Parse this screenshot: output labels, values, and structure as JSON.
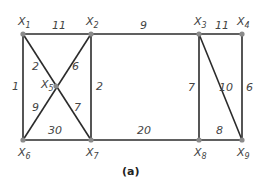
{
  "caption": "(a)",
  "colors": {
    "edge": "#2b2b2b",
    "node": "#8a8a8a",
    "text": "#444444"
  },
  "nodes": [
    {
      "id": "X1",
      "base": "X",
      "sub": "1",
      "x": 23,
      "y": 34
    },
    {
      "id": "X2",
      "base": "X",
      "sub": "2",
      "x": 91,
      "y": 34
    },
    {
      "id": "X3",
      "base": "X",
      "sub": "3",
      "x": 199,
      "y": 34
    },
    {
      "id": "X4",
      "base": "X",
      "sub": "4",
      "x": 242,
      "y": 34
    },
    {
      "id": "X5",
      "base": "X",
      "sub": "5",
      "x": 56,
      "y": 86
    },
    {
      "id": "X6",
      "base": "X",
      "sub": "6",
      "x": 23,
      "y": 140
    },
    {
      "id": "X7",
      "base": "X",
      "sub": "7",
      "x": 91,
      "y": 140
    },
    {
      "id": "X8",
      "base": "X",
      "sub": "8",
      "x": 199,
      "y": 140
    },
    {
      "id": "X9",
      "base": "X",
      "sub": "9",
      "x": 242,
      "y": 140
    }
  ],
  "edges": [
    {
      "from": "X1",
      "to": "X2",
      "weight": "11"
    },
    {
      "from": "X2",
      "to": "X3",
      "weight": "9"
    },
    {
      "from": "X3",
      "to": "X4",
      "weight": "11"
    },
    {
      "from": "X1",
      "to": "X6",
      "weight": "1"
    },
    {
      "from": "X1",
      "to": "X5",
      "weight": "2"
    },
    {
      "from": "X2",
      "to": "X5",
      "weight": "6"
    },
    {
      "from": "X2",
      "to": "X7",
      "weight": "2"
    },
    {
      "from": "X5",
      "to": "X6",
      "weight": "9"
    },
    {
      "from": "X5",
      "to": "X7",
      "weight": "7"
    },
    {
      "from": "X6",
      "to": "X7",
      "weight": "30"
    },
    {
      "from": "X7",
      "to": "X8",
      "weight": "20"
    },
    {
      "from": "X3",
      "to": "X8",
      "weight": "7"
    },
    {
      "from": "X3",
      "to": "X9",
      "weight": "10"
    },
    {
      "from": "X4",
      "to": "X9",
      "weight": "6"
    },
    {
      "from": "X8",
      "to": "X9",
      "weight": "8"
    }
  ]
}
